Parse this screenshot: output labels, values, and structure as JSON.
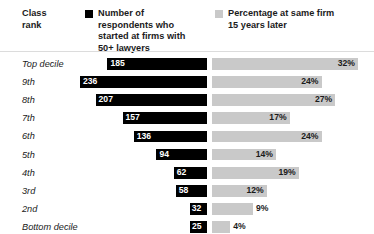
{
  "header": {
    "row_axis_title": "Class\nrank",
    "row_axis_title_line1": "Class",
    "row_axis_title_line2": "rank",
    "legend": [
      {
        "swatch_name": "legend-swatch-black",
        "color": "#000000",
        "label": "Number of respondents who started at firms with 50+ lawyers"
      },
      {
        "swatch_name": "legend-swatch-gray",
        "color": "#c9c9c9",
        "label": "Percentage at same firm 15 years later"
      }
    ]
  },
  "colors": {
    "count_bar": "#000000",
    "percent_bar": "#c9c9c9",
    "text": "#1b1b1b",
    "rule": "#dcdcdc",
    "background": "#ffffff"
  },
  "chart_data": {
    "type": "bar",
    "title": "",
    "subtitle": "",
    "orientation": "horizontal",
    "layout": "diverging-paired",
    "xlabel": "",
    "ylabel": "Class rank",
    "grid": false,
    "legend_position": "top",
    "categories": [
      "Top decile",
      "9th",
      "8th",
      "7th",
      "6th",
      "5th",
      "4th",
      "3rd",
      "2nd",
      "Bottom decile"
    ],
    "series": [
      {
        "name": "Number of respondents who started at firms with 50+ lawyers",
        "color": "#000000",
        "direction": "left",
        "unit": "respondents",
        "values": [
          185,
          236,
          207,
          157,
          136,
          94,
          62,
          58,
          32,
          25
        ],
        "labels": [
          "185",
          "236",
          "207",
          "157",
          "136",
          "94",
          "62",
          "58",
          "32",
          "25"
        ],
        "max": 236
      },
      {
        "name": "Percentage at same firm 15 years later",
        "color": "#c9c9c9",
        "direction": "right",
        "unit": "%",
        "values": [
          32,
          24,
          27,
          17,
          24,
          14,
          19,
          12,
          9,
          4
        ],
        "labels": [
          "32%",
          "24%",
          "27%",
          "17%",
          "24%",
          "14%",
          "19%",
          "12%",
          "9%",
          "4%"
        ],
        "max": 32
      }
    ],
    "rows": [
      {
        "rank": "Top decile",
        "count": 185,
        "count_label": "185",
        "percent": 32,
        "percent_label": "32%"
      },
      {
        "rank": "9th",
        "count": 236,
        "count_label": "236",
        "percent": 24,
        "percent_label": "24%"
      },
      {
        "rank": "8th",
        "count": 207,
        "count_label": "207",
        "percent": 27,
        "percent_label": "27%"
      },
      {
        "rank": "7th",
        "count": 157,
        "count_label": "157",
        "percent": 17,
        "percent_label": "17%"
      },
      {
        "rank": "6th",
        "count": 136,
        "count_label": "136",
        "percent": 24,
        "percent_label": "24%"
      },
      {
        "rank": "5th",
        "count": 94,
        "count_label": "94",
        "percent": 14,
        "percent_label": "14%"
      },
      {
        "rank": "4th",
        "count": 62,
        "count_label": "62",
        "percent": 19,
        "percent_label": "19%"
      },
      {
        "rank": "3rd",
        "count": 58,
        "count_label": "58",
        "percent": 12,
        "percent_label": "12%"
      },
      {
        "rank": "2nd",
        "count": 32,
        "count_label": "32",
        "percent": 9,
        "percent_label": "9%"
      },
      {
        "rank": "Bottom decile",
        "count": 25,
        "count_label": "25",
        "percent": 4,
        "percent_label": "4%"
      }
    ]
  }
}
